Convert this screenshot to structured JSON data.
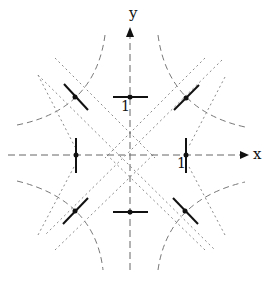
{
  "diagram": {
    "axes": {
      "x_label": "x",
      "y_label": "y",
      "origin": [
        130,
        155
      ]
    },
    "tick_labels": {
      "y_unit": "1",
      "x_unit": "1"
    },
    "colors": {
      "ink": "#111111",
      "dashed": "#777777",
      "dotted": "#8a8a8a"
    },
    "points": [
      {
        "name": "top",
        "x": 130,
        "y": 97,
        "segment": "horizontal"
      },
      {
        "name": "bottom",
        "x": 130,
        "y": 212,
        "segment": "horizontal"
      },
      {
        "name": "left",
        "x": 76,
        "y": 155,
        "segment": "vertical"
      },
      {
        "name": "right",
        "x": 186,
        "y": 155,
        "segment": "vertical"
      },
      {
        "name": "upper-left",
        "x": 75,
        "y": 97,
        "segment": "diag-down"
      },
      {
        "name": "upper-right",
        "x": 186,
        "y": 98,
        "segment": "diag-up"
      },
      {
        "name": "lower-left",
        "x": 75,
        "y": 211,
        "segment": "diag-up"
      },
      {
        "name": "lower-right",
        "x": 185,
        "y": 211,
        "segment": "diag-down"
      }
    ]
  }
}
